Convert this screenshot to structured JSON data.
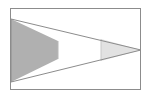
{
  "figure": {
    "canvas": {
      "width": 150,
      "height": 99,
      "background_color": "#ffffff"
    },
    "frame": {
      "name": "outer-rectangle-border",
      "x": 10,
      "y": 8,
      "width": 131,
      "height": 82,
      "stroke_color": "#8c8c8c",
      "stroke_width": 1,
      "fill": "none"
    },
    "triangle": {
      "name": "horizontal-triangle",
      "description": "Triangle with vertical base at left edge and apex at right edge",
      "base_x": 11,
      "base_top_y": 19,
      "base_bottom_y": 82,
      "apex_x": 141,
      "apex_y": 50,
      "outline_color": "#8c8c8c",
      "outline_width": 1
    },
    "bands": [
      {
        "name": "left-dark-band",
        "label": "Dark gray band",
        "x_start": 11,
        "x_end": 58,
        "fill_color": "#b0b0b0",
        "top_y_start": 19,
        "top_y_end": 41,
        "bottom_y_start": 82,
        "bottom_y_end": 59
      },
      {
        "name": "middle-white-band",
        "label": "White band",
        "x_start": 58,
        "x_end": 101,
        "fill_color": "#ffffff",
        "top_y_start": 41,
        "top_y_end": 61,
        "bottom_y_start": 59,
        "bottom_y_end": 39
      },
      {
        "name": "right-light-band",
        "label": "Light gray band",
        "x_start": 101,
        "x_end": 141,
        "fill_color": "#e2e2e2",
        "top_y_start": 61,
        "top_y_end": 50,
        "bottom_y_start": 39,
        "bottom_y_end": 50
      }
    ],
    "divider_lines": [
      {
        "name": "divider-line-1",
        "x": 58,
        "y_top": 41,
        "y_bottom": 59,
        "color": "#b8b8b8"
      },
      {
        "name": "divider-line-2",
        "x": 101,
        "y_top": 61,
        "y_bottom": 39,
        "color": "#c8c8c8"
      }
    ]
  }
}
